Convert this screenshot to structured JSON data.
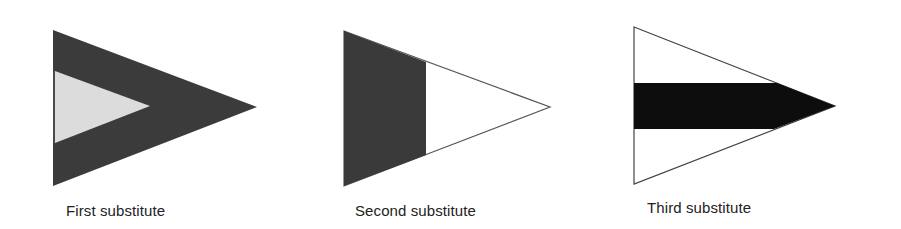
{
  "diagram": {
    "flags": [
      {
        "id": "first",
        "label": "First substitute",
        "description": "Dark triangular pennant with light inner triangle",
        "outer_color": "#3b3b3b",
        "inner_color": "#dcdcdc"
      },
      {
        "id": "second",
        "label": "Second substitute",
        "description": "Triangular pennant, dark at hoist, white at fly",
        "hoist_color": "#3a3a3a",
        "fly_color": "#ffffff"
      },
      {
        "id": "third",
        "label": "Third substitute",
        "description": "White triangular pennant with black horizontal band to the tip",
        "field_color": "#ffffff",
        "band_color": "#0d0d0d"
      }
    ]
  }
}
